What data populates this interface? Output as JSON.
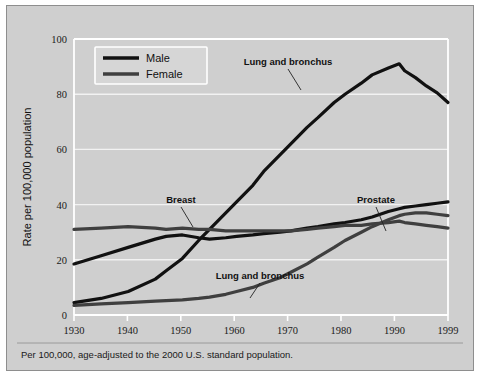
{
  "figure": {
    "background_color": "#cfcfcf",
    "panel_color": "#cfcfcf",
    "border_color": "#8e8e8e"
  },
  "footnote": "Per 100,000, age-adjusted to the 2000 U.S. standard population.",
  "legend": {
    "position": "top-left-inside",
    "entries": [
      {
        "label": "Male",
        "color": "#111111"
      },
      {
        "label": "Female",
        "color": "#3f3f3f"
      }
    ]
  },
  "annotations": [
    {
      "id": "lung-male",
      "text": "Lung and bronchus"
    },
    {
      "id": "breast",
      "text": "Breast"
    },
    {
      "id": "prostate",
      "text": "Prostate"
    },
    {
      "id": "lung-female",
      "text": "Lung and bronchus"
    }
  ],
  "chart_data": {
    "type": "line",
    "title": "",
    "subtitle": "",
    "xlabel": "",
    "ylabel": "Rate per 100,000 population",
    "xlim": [
      1930,
      1999
    ],
    "ylim": [
      0,
      100
    ],
    "xticks": [
      1930,
      1940,
      1950,
      1960,
      1970,
      1980,
      1990,
      1999
    ],
    "xtick_labels": [
      "1930",
      "1940",
      "1950",
      "1960",
      "1970",
      "1980",
      "1990",
      "1999"
    ],
    "yticks": [
      0,
      20,
      40,
      60,
      80,
      100
    ],
    "ytick_labels": [
      "0",
      "20",
      "40",
      "60",
      "80",
      "100"
    ],
    "grid": true,
    "grid_axis": "y",
    "legend_position": "upper left",
    "x": [
      1930,
      1935,
      1940,
      1945,
      1947,
      1950,
      1953,
      1955,
      1958,
      1960,
      1963,
      1965,
      1968,
      1970,
      1973,
      1975,
      1978,
      1980,
      1983,
      1985,
      1988,
      1990,
      1991,
      1993,
      1995,
      1997,
      1999
    ],
    "series": [
      {
        "name": "Lung and bronchus",
        "sex": "Male",
        "color": "#111111",
        "label_text": "Lung and bronchus",
        "values": [
          4.5,
          6.0,
          8.5,
          13.0,
          16.0,
          20.5,
          27.0,
          31.0,
          37.0,
          41.0,
          47.0,
          52.0,
          58.0,
          62.0,
          68.0,
          71.5,
          77.0,
          80.0,
          84.0,
          87.0,
          89.5,
          91.0,
          88.5,
          86.0,
          83.0,
          80.5,
          77.0
        ]
      },
      {
        "name": "Prostate",
        "sex": "Male",
        "color": "#111111",
        "label_text": "Prostate",
        "values": [
          18.5,
          21.5,
          24.5,
          27.5,
          28.5,
          29.0,
          28.0,
          27.5,
          28.0,
          28.5,
          29.0,
          29.5,
          30.0,
          30.5,
          31.5,
          32.0,
          33.0,
          33.5,
          34.5,
          35.5,
          37.5,
          38.5,
          39.0,
          39.5,
          40.0,
          40.5,
          41.0
        ]
      },
      {
        "name": "Breast",
        "sex": "Female",
        "color": "#3f3f3f",
        "label_text": "Breast",
        "values": [
          31.0,
          31.5,
          32.0,
          31.5,
          31.0,
          31.5,
          31.0,
          31.0,
          30.5,
          30.5,
          30.5,
          30.5,
          30.5,
          30.5,
          31.0,
          31.5,
          32.0,
          32.5,
          32.5,
          33.0,
          33.5,
          34.0,
          33.5,
          33.0,
          32.5,
          32.0,
          31.5
        ]
      },
      {
        "name": "Lung and bronchus",
        "sex": "Female",
        "color": "#3f3f3f",
        "label_text": "Lung and bronchus",
        "values": [
          3.5,
          4.0,
          4.5,
          5.0,
          5.2,
          5.5,
          6.0,
          6.5,
          7.5,
          8.5,
          10.0,
          11.5,
          13.5,
          15.5,
          18.5,
          21.0,
          24.5,
          27.0,
          30.0,
          32.0,
          34.5,
          36.0,
          36.5,
          37.0,
          37.0,
          36.5,
          36.0
        ]
      }
    ],
    "notable_points": [
      {
        "label": "Male lung peak",
        "x": 1990,
        "y": 91
      },
      {
        "label": "Male lung 1999",
        "x": 1999,
        "y": 77
      },
      {
        "label": "Prostate 1999",
        "x": 1999,
        "y": 41
      },
      {
        "label": "Female lung 1999",
        "x": 1999,
        "y": 36
      },
      {
        "label": "Breast 1999",
        "x": 1999,
        "y": 31.5
      },
      {
        "label": "Male lung crosses breast",
        "x": 1955,
        "y": 31
      },
      {
        "label": "Prostate crosses breast",
        "x": 1989,
        "y": 34
      }
    ]
  }
}
